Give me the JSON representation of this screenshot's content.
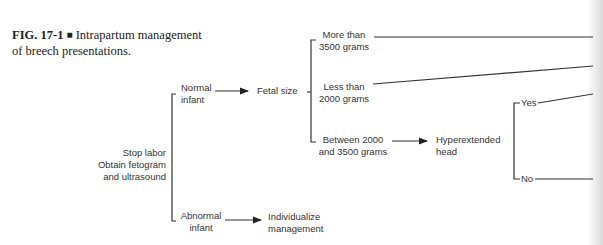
{
  "caption": {
    "figure_number": "FIG. 17-1",
    "separator": "■",
    "title_line1": "Intrapartum management",
    "title_line2": "of breech presentations."
  },
  "nodes": {
    "root": {
      "line1": "Stop labor",
      "line2": "Obtain fetogram",
      "line3": "and ultrasound"
    },
    "normal_infant": {
      "line1": "Normal",
      "line2": "infant"
    },
    "abnormal_infant": {
      "line1": "Abnormal",
      "line2": "infant"
    },
    "fetal_size": {
      "line1": "Fetal size"
    },
    "individualize": {
      "line1": "Individualize",
      "line2": "management"
    },
    "more_than_3500": {
      "line1": "More than",
      "line2": "3500 grams"
    },
    "less_than_2000": {
      "line1": "Less than",
      "line2": "2000 grams"
    },
    "between": {
      "line1": "Between 2000",
      "line2": "and 3500 grams"
    },
    "hyperextended": {
      "line1": "Hyperextended",
      "line2": "head"
    },
    "yes": {
      "line1": "Yes"
    },
    "no": {
      "line1": "No"
    }
  },
  "edges": [
    {
      "from": "root",
      "to": "normal_infant",
      "type": "bracket"
    },
    {
      "from": "root",
      "to": "abnormal_infant",
      "type": "bracket"
    },
    {
      "from": "normal_infant",
      "to": "fetal_size",
      "type": "arrow"
    },
    {
      "from": "abnormal_infant",
      "to": "individualize",
      "type": "arrow"
    },
    {
      "from": "fetal_size",
      "to": "more_than_3500",
      "type": "bracket"
    },
    {
      "from": "fetal_size",
      "to": "less_than_2000",
      "type": "bracket"
    },
    {
      "from": "fetal_size",
      "to": "between",
      "type": "bracket"
    },
    {
      "from": "between",
      "to": "hyperextended",
      "type": "arrow"
    },
    {
      "from": "hyperextended",
      "to": "yes",
      "type": "bracket"
    },
    {
      "from": "hyperextended",
      "to": "no",
      "type": "bracket"
    },
    {
      "from": "more_than_3500",
      "to": "offpage",
      "type": "line"
    },
    {
      "from": "less_than_2000",
      "to": "offpage",
      "type": "line"
    },
    {
      "from": "yes",
      "to": "offpage",
      "type": "line"
    },
    {
      "from": "no",
      "to": "offpage",
      "type": "line"
    }
  ]
}
